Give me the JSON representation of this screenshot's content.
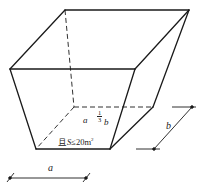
{
  "diagram": {
    "type": "pit-frustum",
    "labels": {
      "inner_a": "a",
      "fraction_num": "1",
      "fraction_den": "3",
      "inner_b": "b",
      "area_prefix": "且",
      "area_var": "S",
      "area_rel": "≤20m",
      "area_sup": "2",
      "dim_a": "a",
      "dim_b": "b"
    },
    "colors": {
      "line": "#1a1a1a",
      "background": "#ffffff"
    }
  }
}
